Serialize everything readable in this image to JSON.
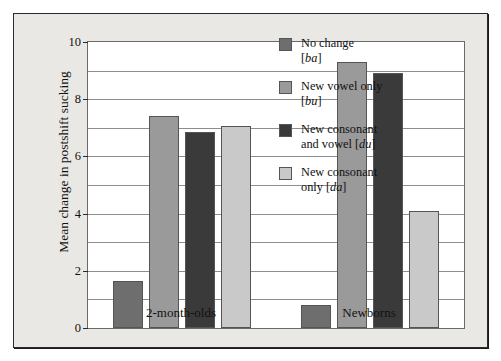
{
  "chart_data": {
    "type": "bar",
    "title": "",
    "xlabel": "",
    "ylabel": "Mean change in postshift sucking",
    "categories": [
      "2-month-olds",
      "Newborns"
    ],
    "ylim": [
      0,
      10
    ],
    "yticks": [
      0,
      2,
      4,
      6,
      8,
      10
    ],
    "ytick_labels": [
      "0",
      "2",
      "4",
      "6",
      "8",
      "10"
    ],
    "gridlines": [
      1,
      2,
      3,
      4,
      5,
      6,
      7,
      8,
      9
    ],
    "grid": true,
    "legend_position": "right-inside",
    "series": [
      {
        "name": "No change [ba]",
        "label_line1": "No change",
        "label_line2": "[ba]",
        "color": "#6e6e6e",
        "values": [
          1.65,
          0.8
        ]
      },
      {
        "name": "New vowel only [bu]",
        "label_line1": "New vowel only",
        "label_line2": "[bu]",
        "color": "#9a9a9a",
        "values": [
          7.4,
          9.3
        ]
      },
      {
        "name": "New consonant and vowel [du]",
        "label_line1": "New consonant",
        "label_line2": "and vowel [du]",
        "color": "#3a3a3a",
        "values": [
          6.85,
          8.9
        ]
      },
      {
        "name": "New consonant only [da]",
        "label_line1": "New consonant",
        "label_line2": "only [da]",
        "color": "#c9c9c9",
        "values": [
          7.05,
          4.1
        ]
      }
    ]
  },
  "colors": {
    "figure_background": "#e9e8e4",
    "plot_background": "#ffffff",
    "frame": "#2a2a2a",
    "gridline": "#8d8d8d"
  }
}
